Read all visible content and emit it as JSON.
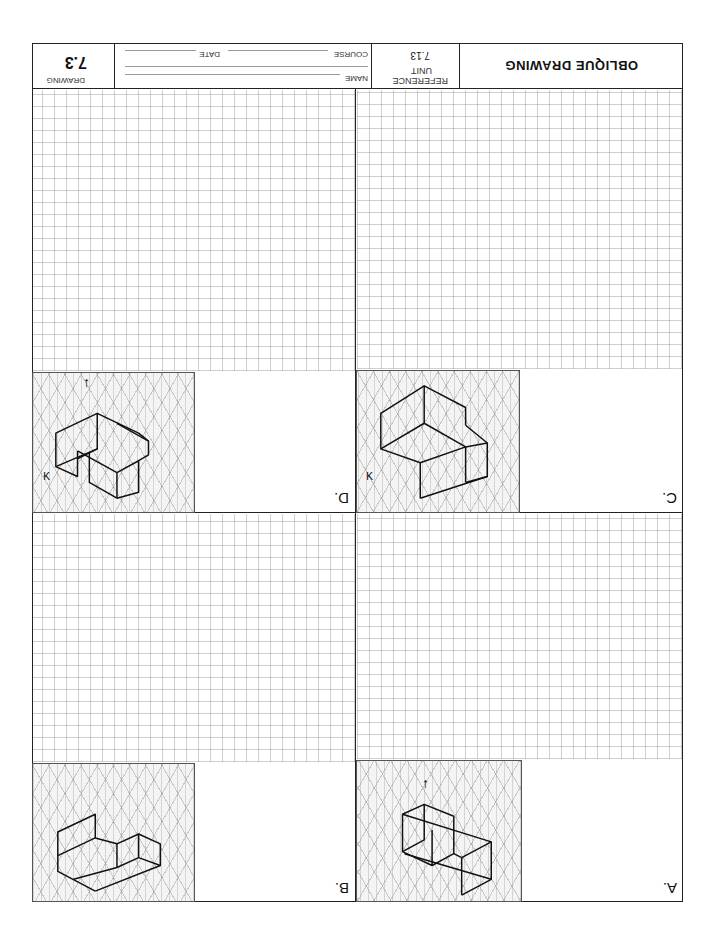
{
  "document": {
    "orientation": "rotated 180 degrees",
    "title_block": {
      "title": "OBLIQUE DRAWING",
      "reference_label": "REFERENCE",
      "unit_label": "UNIT",
      "unit_value": "7.13",
      "name_label": "NAME",
      "course_label": "COURSE",
      "date_label": "DATE",
      "drawing_label": "DRAWING",
      "drawing_number": "7.3"
    },
    "panels": [
      {
        "id": "A",
        "label": "A.",
        "has_arrow": true,
        "has_k_mark": false
      },
      {
        "id": "B",
        "label": "B.",
        "has_arrow": false,
        "has_k_mark": false
      },
      {
        "id": "C",
        "label": "C.",
        "has_arrow": false,
        "has_k_mark": true
      },
      {
        "id": "D",
        "label": "D.",
        "has_arrow": true,
        "has_k_mark": true
      }
    ],
    "marks": {
      "arrow": "↑",
      "k_mark": "K"
    }
  }
}
